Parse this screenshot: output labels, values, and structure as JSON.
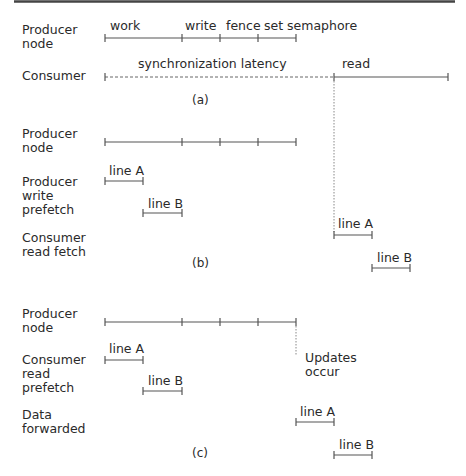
{
  "sections": {
    "a": {
      "caption": "(a)",
      "rows": {
        "producer": {
          "label_lines": [
            "Producer",
            "node"
          ]
        },
        "consumer": {
          "label_lines": [
            "Consumer"
          ]
        }
      },
      "producer_phases": [
        "work",
        "write",
        "fence",
        "set semaphore"
      ],
      "consumer_phases": {
        "wait": "synchronization latency",
        "read": "read"
      }
    },
    "b": {
      "caption": "(b)",
      "rows": {
        "producer": {
          "label_lines": [
            "Producer",
            "node"
          ]
        },
        "write_prefetch": {
          "label_lines": [
            "Producer",
            "write",
            "prefetch"
          ]
        },
        "read_fetch": {
          "label_lines": [
            "Consumer",
            "read fetch"
          ]
        }
      },
      "write_prefetch_items": [
        "line A",
        "line B"
      ],
      "read_fetch_items": [
        "line A",
        "line B"
      ]
    },
    "c": {
      "caption": "(c)",
      "rows": {
        "producer": {
          "label_lines": [
            "Producer",
            "node"
          ]
        },
        "read_prefetch": {
          "label_lines": [
            "Consumer",
            "read",
            "prefetch"
          ]
        },
        "forwarded": {
          "label_lines": [
            "Data",
            "forwarded"
          ]
        }
      },
      "annotation_lines": [
        "Updates",
        "occur"
      ],
      "read_prefetch_items": [
        "line A",
        "line B"
      ],
      "forwarded_items": [
        "line A",
        "line B"
      ]
    }
  }
}
